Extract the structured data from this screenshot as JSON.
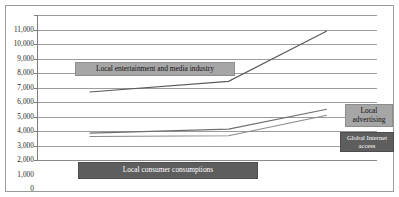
{
  "chart_data": {
    "type": "line",
    "title": "",
    "subtitle": "",
    "xlabel": "",
    "ylabel": "",
    "ylim": [
      0,
      11000
    ],
    "ytick_labels": [
      "11,000",
      "10,000",
      "9,000",
      "8,000",
      "7,000",
      "6,000",
      "5,000",
      "4,000",
      "3,000",
      "2,000",
      "1,000",
      "0"
    ],
    "ytick_values": [
      11000,
      10000,
      9000,
      8000,
      7000,
      6000,
      5000,
      4000,
      3000,
      2000,
      1000,
      0
    ],
    "grid": true,
    "grid_axis": "y",
    "legend_position": "inline-callouts",
    "x": [
      0,
      1,
      2
    ],
    "xtick_labels": [
      "",
      "",
      ""
    ],
    "series": [
      {
        "name": "Local entertainment and media industry",
        "values": [
          5200,
          6000,
          9800
        ],
        "color": "#5a5a5a"
      },
      {
        "name": "Local advertising",
        "values": [
          2100,
          2400,
          3900
        ],
        "color": "#6e6e6e"
      },
      {
        "name": "Global Internet access",
        "values": [
          1850,
          1900,
          3450
        ],
        "color": "#8a8a8a"
      }
    ],
    "annotations": [
      {
        "id": "entertainment",
        "text": "Local entertainment and media industry",
        "style": "light"
      },
      {
        "id": "consumer",
        "text": "Local consumer consumptions",
        "style": "dark"
      },
      {
        "id": "advertising",
        "text": "Local advertising",
        "style": "light"
      },
      {
        "id": "internet",
        "text": "Global Internet access",
        "style": "dark"
      }
    ]
  },
  "colors": {
    "background": "#ffffff",
    "frame": "#9a9a9a",
    "gridline": "#9c9c9c",
    "axis": "#7d7d7d",
    "callout_light_bg": "#a6a6a6",
    "callout_dark_bg": "#5e5e5e",
    "text": "#1a1a1a"
  },
  "axis": {
    "ytick_0": "11,000",
    "ytick_1": "10,000",
    "ytick_2": "9,000",
    "ytick_3": "8,000",
    "ytick_4": "7,000",
    "ytick_5": "6,000",
    "ytick_6": "5,000",
    "ytick_7": "4,000",
    "ytick_8": "3,000",
    "ytick_9": "2,000",
    "ytick_10": "1,000",
    "ytick_11": "0"
  },
  "labels": {
    "entertainment": "Local entertainment and media industry",
    "consumer": "Local consumer consumptions",
    "advertising": "Local advertising",
    "internet": "Global Internet access"
  }
}
